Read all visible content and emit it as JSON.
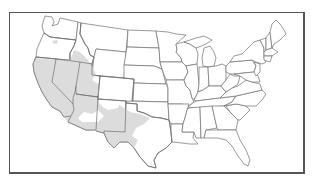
{
  "map": {
    "title": "",
    "region": "Contiguous United States",
    "style": "state outline map with shaded range",
    "colors": {
      "background": "#ffffff",
      "state_fill": "#ffffff",
      "state_border": "#6e6e6e",
      "shaded_range": "#dcdcdc",
      "frame_border": "#555555"
    },
    "shaded_areas": [
      "California",
      "Nevada",
      "Western Utah",
      "Southern Idaho",
      "Central Oregon (small patch)",
      "Arizona (western and southern)",
      "New Mexico (partial)",
      "West Texas",
      "Southwestern Colorado edge"
    ]
  }
}
